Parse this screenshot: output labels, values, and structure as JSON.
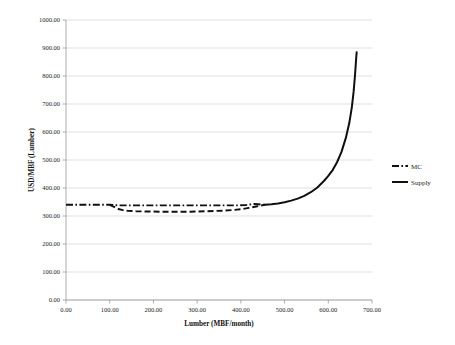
{
  "chart_data": {
    "type": "line",
    "title": "",
    "xlabel": "Lumber (MBF/month)",
    "ylabel": "USD/MBF (Lumber)",
    "xlim": [
      0,
      700
    ],
    "ylim": [
      0,
      1000
    ],
    "xticks": [
      "0.00",
      "100.00",
      "200.00",
      "300.00",
      "400.00",
      "500.00",
      "600.00",
      "700.00"
    ],
    "xtick_values": [
      0,
      100,
      200,
      300,
      400,
      500,
      600,
      700
    ],
    "yticks": [
      "0.00",
      "100.00",
      "200.00",
      "300.00",
      "400.00",
      "500.00",
      "600.00",
      "700.00",
      "800.00",
      "900.00",
      "1000.00"
    ],
    "ytick_values": [
      0,
      100,
      200,
      300,
      400,
      500,
      600,
      700,
      800,
      900,
      1000
    ],
    "grid": true,
    "grid_axis": "y",
    "legend_position": "right",
    "legend": [
      "MC",
      "Supply"
    ],
    "series": [
      {
        "name": "MC",
        "style": "dash-dot",
        "color": "#101010",
        "x": [
          0,
          20,
          40,
          60,
          80,
          100,
          110,
          120,
          140,
          160,
          180,
          200,
          220,
          240,
          260,
          280,
          300,
          320,
          340,
          360,
          380,
          395,
          410,
          420,
          430,
          440,
          450,
          460
        ],
        "y": [
          340,
          340,
          340,
          340,
          340,
          340,
          339,
          338,
          338,
          338,
          338,
          338,
          338,
          338,
          338,
          338,
          338,
          338,
          338,
          338,
          338,
          338,
          339,
          341,
          343,
          342,
          340,
          340
        ]
      },
      {
        "name": "MC-lower-branch",
        "style": "dashed",
        "color": "#101010",
        "x": [
          100,
          110,
          120,
          130,
          140,
          160,
          180,
          200,
          220,
          240,
          260,
          280,
          300,
          320,
          340,
          360,
          380,
          400,
          415,
          425,
          435,
          445,
          455
        ],
        "y": [
          340,
          333,
          325,
          321,
          319,
          317,
          316,
          316,
          315,
          315,
          315,
          315,
          316,
          317,
          318,
          319,
          321,
          324,
          328,
          331,
          334,
          337,
          340
        ]
      },
      {
        "name": "Supply",
        "style": "solid",
        "color": "#101010",
        "x": [
          455,
          470,
          485,
          500,
          515,
          530,
          545,
          560,
          575,
          590,
          600,
          610,
          620,
          630,
          640,
          648,
          654,
          658,
          661,
          663,
          664,
          665
        ],
        "y": [
          340,
          342,
          345,
          349,
          355,
          362,
          372,
          385,
          402,
          425,
          443,
          464,
          492,
          528,
          578,
          632,
          690,
          745,
          800,
          845,
          868,
          885
        ]
      }
    ]
  },
  "legend_items": [
    {
      "label": "MC",
      "style": "dash-dot"
    },
    {
      "label": "Supply",
      "style": "solid"
    }
  ]
}
